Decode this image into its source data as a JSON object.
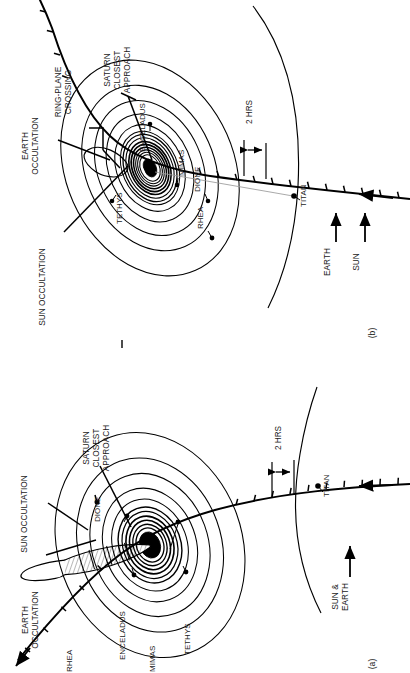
{
  "figure": {
    "type": "diagram",
    "orientation_note": "page rotated 90 degrees; all text reads bottom-to-top",
    "panels": [
      {
        "id": "a",
        "label": "(a)",
        "view": "ring plane nearly edge-on",
        "direction_arrows": [
          {
            "name": "sun-and-earth-arrow",
            "label": "SUN &\nEARTH",
            "line1": "SUN &",
            "line2": "EARTH"
          }
        ],
        "scale_bar": {
          "label": "2 HRS",
          "ticks": "tick marks along trajectory at 2 hour intervals"
        },
        "event_labels": [
          {
            "name": "sun-occultation",
            "text": "SUN OCCULTATION"
          },
          {
            "name": "earth-occultation",
            "line1": "EARTH",
            "line2": "OCCULTATION"
          },
          {
            "name": "saturn-closest-approach",
            "line1": "SATURN",
            "line2": "CLOSEST",
            "line3": "APPROACH"
          }
        ],
        "moon_labels": [
          {
            "name": "rhea",
            "text": "RHEA"
          },
          {
            "name": "dione",
            "text": "DIONE"
          },
          {
            "name": "enceladus",
            "text": "ENCELADUS"
          },
          {
            "name": "mimas",
            "text": "MIMAS"
          },
          {
            "name": "tethys",
            "text": "TETHYS"
          },
          {
            "name": "titan",
            "text": "TITAN"
          }
        ]
      },
      {
        "id": "b",
        "label": "(b)",
        "view": "ring plane open / face-on",
        "direction_arrows": [
          {
            "name": "sun-arrow",
            "label": "SUN"
          },
          {
            "name": "earth-arrow",
            "label": "EARTH"
          }
        ],
        "scale_bar": {
          "label": "2 HRS",
          "ticks": "tick marks along trajectory at 2 hour intervals"
        },
        "event_labels": [
          {
            "name": "earth-occultation",
            "line1": "EARTH",
            "line2": "OCCULTATION"
          },
          {
            "name": "ring-plane-crossing",
            "line1": "RING-PLANE",
            "line2": "CROSSING"
          },
          {
            "name": "sun-occultation",
            "text": "SUN OCCULTATION"
          },
          {
            "name": "saturn-closest-approach",
            "line1": "SATURN",
            "line2": "CLOSEST",
            "line3": "APPROACH"
          }
        ],
        "moon_labels": [
          {
            "name": "enceladus",
            "text": "ENCELADUS"
          },
          {
            "name": "mimas",
            "text": "MIMAS"
          },
          {
            "name": "tethys",
            "text": "TETHYS"
          },
          {
            "name": "dione",
            "text": "DIONE"
          },
          {
            "name": "rhea",
            "text": "RHEA"
          },
          {
            "name": "titan",
            "text": "TITAN"
          }
        ]
      }
    ],
    "colors": {
      "ink": "#000000",
      "paper": "#ffffff",
      "hatch": "#8a8a8a"
    }
  }
}
